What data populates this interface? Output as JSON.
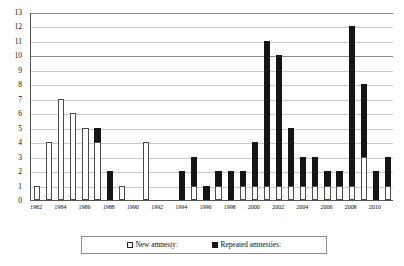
{
  "chart_data": {
    "type": "bar",
    "subtype": "stacked-vertical",
    "title": "",
    "xlabel": "",
    "ylabel": "",
    "ylim": [
      0,
      13
    ],
    "ytick_step": 1,
    "yticks": [
      0,
      1,
      2,
      3,
      4,
      5,
      6,
      7,
      8,
      9,
      10,
      11,
      12,
      13
    ],
    "grid": true,
    "grid_axis": "y",
    "legend_position": "bottom-center",
    "categories": [
      "1982",
      "1983",
      "1984",
      "1985",
      "1986",
      "1987",
      "1988",
      "1989",
      "1990",
      "1991",
      "1992",
      "1993",
      "1994",
      "1995",
      "1996",
      "1997",
      "1998",
      "1999",
      "2000",
      "2001",
      "2002",
      "2003",
      "2004",
      "2005",
      "2006",
      "2007",
      "2008",
      "2009",
      "2010",
      "2011"
    ],
    "xtick_labels": [
      "1982",
      "1984",
      "1986",
      "1988",
      "1990",
      "1992",
      "1994",
      "1996",
      "1998",
      "2000",
      "2002",
      "2004",
      "2006",
      "2008",
      "2010"
    ],
    "series": [
      {
        "name": "New amnesty:",
        "color": "#ffffff",
        "edge_color": "#4a4a4a",
        "values": [
          1,
          4,
          7,
          6,
          5,
          4,
          0,
          1,
          0,
          4,
          0,
          0,
          0,
          1,
          0,
          1,
          0,
          1,
          1,
          1,
          1,
          1,
          1,
          1,
          1,
          1,
          1,
          3,
          0,
          1
        ]
      },
      {
        "name": "Repeated amnesties:",
        "color": "#151515",
        "edge_color": "#151515",
        "values": [
          0,
          0,
          0,
          0,
          0,
          1,
          2,
          0,
          0,
          0,
          0,
          0,
          2,
          2,
          1,
          1,
          2,
          1,
          3,
          10,
          9,
          4,
          2,
          2,
          1,
          1,
          11,
          5,
          2,
          2
        ]
      }
    ],
    "totals": [
      1,
      4,
      7,
      6,
      5,
      5,
      2,
      1,
      0,
      4,
      0,
      0,
      2,
      3,
      1,
      2,
      2,
      2,
      4,
      11,
      10,
      5,
      3,
      3,
      2,
      2,
      12,
      8,
      2,
      3
    ]
  },
  "legend": {
    "items": [
      {
        "label": "New amnesty:",
        "swatch": "hollow-square"
      },
      {
        "label": "Repeated amnesties:",
        "swatch": "filled-square"
      }
    ]
  },
  "colors": {
    "new_amnesty": "#ffffff",
    "repeated_amnesties": "#151515",
    "grid": "#c9c9c9",
    "grid_major": "#8a8a8a",
    "axis": "#555555",
    "background": "#ffffff"
  }
}
